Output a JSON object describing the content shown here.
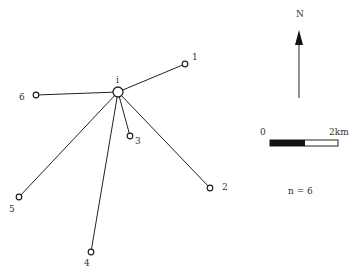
{
  "map": {
    "hub": {
      "id": "i",
      "label": "i",
      "x": 118,
      "y": 92
    },
    "nodes": [
      {
        "id": "1",
        "label": "1",
        "x": 185,
        "y": 64,
        "lx": 192,
        "ly": 60
      },
      {
        "id": "2",
        "label": "2",
        "x": 210,
        "y": 188,
        "lx": 222,
        "ly": 190
      },
      {
        "id": "3",
        "label": "3",
        "x": 130,
        "y": 136,
        "lx": 135,
        "ly": 144
      },
      {
        "id": "4",
        "label": "4",
        "x": 91,
        "y": 252,
        "lx": 84,
        "ly": 266
      },
      {
        "id": "5",
        "label": "5",
        "x": 19,
        "y": 197,
        "lx": 9,
        "ly": 212
      },
      {
        "id": "6",
        "label": "6",
        "x": 36,
        "y": 95,
        "lx": 19,
        "ly": 100
      }
    ],
    "north_label": "N",
    "scale": {
      "start_label": "0",
      "end_label": "2km"
    },
    "count_label": "n = 6",
    "colors": {
      "line": "#222222",
      "bar_fill": "#111111"
    }
  }
}
